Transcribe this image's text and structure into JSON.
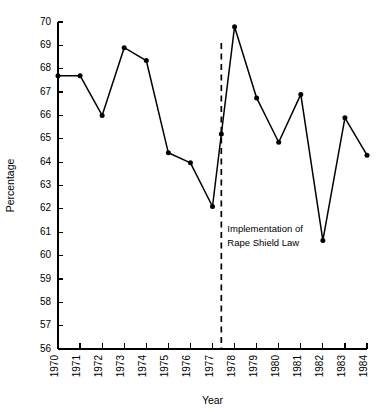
{
  "chart_data": {
    "type": "line",
    "title": "",
    "xlabel": "Year",
    "ylabel": "Percentage",
    "xlim": [
      1970,
      1984
    ],
    "ylim": [
      56,
      70
    ],
    "grid": false,
    "legend": "none",
    "x": [
      1970,
      1971,
      1972,
      1973,
      1974,
      1975,
      1976,
      1977,
      1977.4,
      1978,
      1979,
      1980,
      1981,
      1982,
      1983,
      1984
    ],
    "values": [
      67.7,
      67.7,
      66.0,
      68.9,
      68.35,
      64.4,
      63.97,
      62.1,
      65.2,
      69.8,
      66.75,
      64.85,
      66.9,
      60.65,
      65.9,
      64.3
    ],
    "xtick_labels": [
      "1970",
      "1971",
      "1972",
      "1973",
      "1974",
      "1975",
      "1976",
      "1977",
      "1978",
      "1979",
      "1980",
      "1981",
      "1982",
      "1983",
      "1984"
    ],
    "ytick_labels": [
      "56",
      "57",
      "58",
      "59",
      "60",
      "61",
      "62",
      "63",
      "64",
      "65",
      "66",
      "67",
      "68",
      "69",
      "70"
    ],
    "annotations": [
      {
        "name": "rape-shield-law-marker",
        "x": 1977.4,
        "line1": "Implementation of",
        "line2": "Rape Shield Law"
      }
    ],
    "colors": {
      "line": "#000000",
      "marker": "#000000",
      "axis": "#000000",
      "background": "#ffffff"
    }
  }
}
